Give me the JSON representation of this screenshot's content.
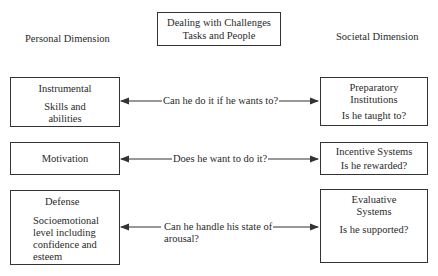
{
  "title": {
    "line1": "Dealing with Challenges",
    "line2": "Tasks and People"
  },
  "headers": {
    "left": "Personal Dimension",
    "right": "Societal Dimension"
  },
  "personal": [
    {
      "title": "Instrumental",
      "body": [
        "Skills and",
        "abilities"
      ]
    },
    {
      "title": "Motivation",
      "body": []
    },
    {
      "title": "Defense",
      "body": [
        "Socioemotional",
        "level including",
        "confidence and",
        "esteem"
      ]
    }
  ],
  "societal": [
    {
      "title": [
        "Preparatory",
        "Institutions"
      ],
      "body": "Is he taught to?"
    },
    {
      "title": [
        "Incentive Systems"
      ],
      "body": "Is he rewarded?"
    },
    {
      "title": [
        "Evaluative",
        "Systems"
      ],
      "body": "Is he supported?"
    }
  ],
  "questions": [
    {
      "lines": [
        "Can he do it if he wants to?"
      ]
    },
    {
      "lines": [
        "Does he want to do it?"
      ]
    },
    {
      "lines": [
        "Can he handle his state of",
        "arousal?"
      ]
    }
  ],
  "colors": {
    "line": "#333333",
    "text": "#2a2a2a",
    "background": "#ffffff"
  }
}
